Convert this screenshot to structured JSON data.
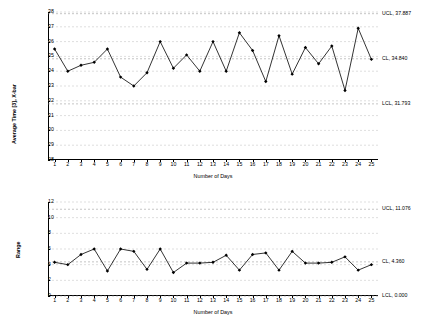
{
  "chart_data": [
    {
      "type": "line",
      "title": "",
      "xlabel": "Number of Days",
      "ylabel": "Average Time [3], X-bar",
      "x": [
        1,
        2,
        3,
        4,
        5,
        6,
        7,
        8,
        9,
        10,
        11,
        12,
        13,
        14,
        15,
        16,
        17,
        18,
        19,
        20,
        21,
        22,
        23,
        24,
        25
      ],
      "categories": [
        "1",
        "2",
        "3",
        "4",
        "5",
        "6",
        "7",
        "8",
        "9",
        "10",
        "11",
        "12",
        "13",
        "14",
        "15",
        "16",
        "17",
        "18",
        "19",
        "20",
        "21",
        "22",
        "23",
        "24",
        "25"
      ],
      "values": [
        35.5,
        34.0,
        34.4,
        34.6,
        35.5,
        33.6,
        33.0,
        33.9,
        36.0,
        34.2,
        35.1,
        34.0,
        36.0,
        34.0,
        36.6,
        35.4,
        33.3,
        36.4,
        33.8,
        35.6,
        34.5,
        35.7,
        32.7,
        36.9,
        34.8
      ],
      "ylim": [
        28,
        38
      ],
      "yticks": [
        28,
        29,
        30,
        31,
        32,
        33,
        34,
        35,
        36,
        37,
        38
      ],
      "grid": true,
      "limits": [
        {
          "name": "UCL",
          "value": 37.887,
          "label": "UCL, 37.887"
        },
        {
          "name": "CL",
          "value": 34.84,
          "label": "CL, 34.840"
        },
        {
          "name": "LCL",
          "value": 31.793,
          "label": "LCL, 31.793"
        }
      ]
    },
    {
      "type": "line",
      "title": "",
      "xlabel": "Number of Days",
      "ylabel": "Range",
      "x": [
        1,
        2,
        3,
        4,
        5,
        6,
        7,
        8,
        9,
        10,
        11,
        12,
        13,
        14,
        15,
        16,
        17,
        18,
        19,
        20,
        21,
        22,
        23,
        24,
        25
      ],
      "categories": [
        "1",
        "2",
        "3",
        "4",
        "5",
        "6",
        "7",
        "8",
        "9",
        "10",
        "11",
        "12",
        "13",
        "14",
        "15",
        "16",
        "17",
        "18",
        "19",
        "20",
        "21",
        "22",
        "23",
        "24",
        "25"
      ],
      "values": [
        4.3,
        4.0,
        5.3,
        6.0,
        3.2,
        6.0,
        5.7,
        3.4,
        6.0,
        3.0,
        4.2,
        4.2,
        4.3,
        5.2,
        3.3,
        5.3,
        5.5,
        3.3,
        5.7,
        4.2,
        4.2,
        4.3,
        5.0,
        3.3,
        4.0
      ],
      "ylim": [
        0,
        12
      ],
      "yticks": [
        0,
        2,
        4,
        6,
        8,
        10,
        12
      ],
      "grid": true,
      "limits": [
        {
          "name": "UCL",
          "value": 11.076,
          "label": "UCL, 11.076"
        },
        {
          "name": "CL",
          "value": 4.36,
          "label": "CL, 4.360"
        },
        {
          "name": "LCL",
          "value": 0.0,
          "label": "LCL, 0.000"
        }
      ]
    }
  ]
}
